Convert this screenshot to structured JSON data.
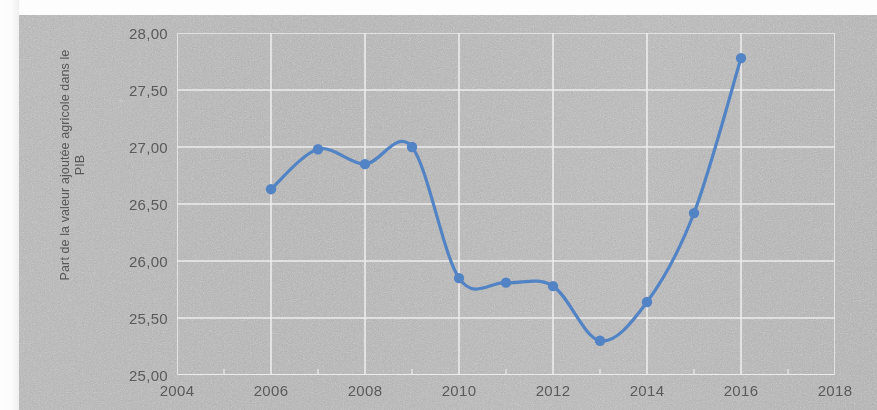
{
  "chart_data": {
    "type": "line",
    "title": "",
    "subtitle": "",
    "xlabel": "",
    "ylabel": "Part de la valeur ajoutée agricole dans le PIB",
    "ylabel_lines": [
      "Part de la valeur ajoutée agricole dans le",
      "PIB"
    ],
    "xlim": [
      2004,
      2018
    ],
    "ylim": [
      25.0,
      28.0
    ],
    "ytick_step": 0.5,
    "xtick_step": 2,
    "ytick_labels": [
      "28,00",
      "27,50",
      "27,00",
      "26,50",
      "26,00",
      "25,50",
      "25,00"
    ],
    "ytick_values": [
      28.0,
      27.5,
      27.0,
      26.5,
      26.0,
      25.5,
      25.0
    ],
    "xtick_labels": [
      "2004",
      "2006",
      "2008",
      "2010",
      "2012",
      "2014",
      "2016",
      "2018"
    ],
    "xtick_values": [
      2004,
      2006,
      2008,
      2010,
      2012,
      2014,
      2016,
      2018
    ],
    "grid": true,
    "legend": false,
    "legend_position": "none",
    "decimal_separator": ",",
    "x": [
      2006,
      2007,
      2008,
      2009,
      2010,
      2011,
      2012,
      2013,
      2014,
      2015,
      2016
    ],
    "values": [
      26.63,
      26.98,
      26.85,
      27.0,
      25.85,
      25.81,
      25.78,
      25.3,
      25.64,
      26.42,
      27.78
    ],
    "series": [
      {
        "name": "Part de la valeur ajoutée agricole dans le PIB",
        "x": [
          2006,
          2007,
          2008,
          2009,
          2010,
          2011,
          2012,
          2013,
          2014,
          2015,
          2016
        ],
        "values": [
          26.63,
          26.98,
          26.85,
          27.0,
          25.85,
          25.81,
          25.78,
          25.3,
          25.64,
          26.42,
          27.78
        ],
        "color": "#5283c4",
        "marker": "circle",
        "smooth": true
      }
    ],
    "annotations": []
  },
  "style": {
    "line_color": "#5283c4",
    "marker_color": "#5283c4",
    "grid_color": "#ececec",
    "plot_background": "#b2b2b2",
    "text_color": "#5a5a5a",
    "page_background": "#b2b2b2"
  }
}
